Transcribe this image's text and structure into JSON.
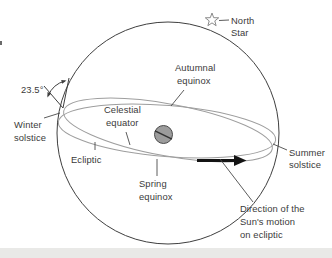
{
  "diagram": {
    "angle_label": "23.5°",
    "labels": {
      "north_star": [
        "North",
        "Star"
      ],
      "autumnal_equinox": [
        "Autumnal",
        "equinox"
      ],
      "celestial_equator": [
        "Celestial",
        "equator"
      ],
      "winter_solstice": [
        "Winter",
        "solstice"
      ],
      "ecliptic": "Ecliptic",
      "spring_equinox": [
        "Spring",
        "equinox"
      ],
      "summer_solstice": [
        "Summer",
        "solstice"
      ],
      "sun_direction": [
        "Direction of the",
        "Sun's motion",
        "on ecliptic"
      ]
    },
    "icons": {
      "north_star_icon": "star-outline",
      "sun_motion_arrow": "arrow-right",
      "tilt_angle_marker": "double-headed-arc-arrow"
    },
    "colors": {
      "background": "#ffffff",
      "sphere_outline": "#3f3f3f",
      "great_circles": "#9e9e9e",
      "leader_lines": "#4a4a4a",
      "text": "#3a3a3a",
      "earth_fill": "#9c9c9c",
      "earth_outline": "#4a4a4a",
      "arrow": "#141414",
      "star_outline": "#8a8a8a",
      "page_strip": "#e9e9e7"
    }
  }
}
